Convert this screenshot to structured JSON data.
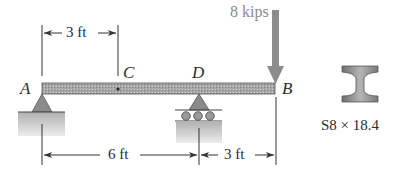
{
  "diagram": {
    "type": "simply supported beam with overhang",
    "points": {
      "A": "A",
      "B": "B",
      "C": "C",
      "D": "D"
    },
    "load": {
      "label": "8 kips",
      "location": "B",
      "direction": "down"
    },
    "dimensions": {
      "top_AC": "3 ft",
      "bottom_AD": "6 ft",
      "bottom_DB": "3 ft"
    },
    "supports": {
      "A": "pin",
      "D": "roller"
    },
    "section": {
      "shape": "I-beam",
      "label": "S8 × 18.4"
    },
    "colors": {
      "beam": "#9a9a9a",
      "load_arrow": "#8c8c8c",
      "ground": "#c8c8c8",
      "text": "#2b2b2b",
      "load_text": "#8a8a8a"
    }
  }
}
